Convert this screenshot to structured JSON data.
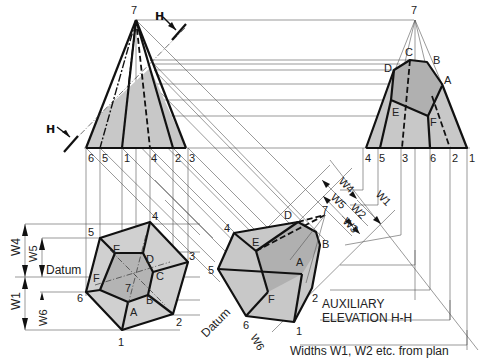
{
  "cutting_plane": {
    "label_top": "H",
    "label_bottom": "H"
  },
  "front_elevation": {
    "apex": "7",
    "base_points": [
      "6",
      "5",
      "1",
      "4",
      "2",
      "3"
    ]
  },
  "end_elevation": {
    "apex": "7",
    "section_points": [
      "C",
      "B",
      "D",
      "A",
      "E",
      "F"
    ],
    "base_points": [
      "4",
      "5",
      "3",
      "6",
      "2",
      "1"
    ]
  },
  "plan": {
    "outer_points": [
      "1",
      "2",
      "3",
      "4",
      "5",
      "6"
    ],
    "inner_points": [
      "A",
      "B",
      "C",
      "D",
      "E",
      "F"
    ],
    "center": "7",
    "datum_label": "Datum",
    "dims": [
      "W4",
      "W5",
      "W1",
      "W6"
    ]
  },
  "auxiliary": {
    "points": [
      "4",
      "5",
      "6",
      "1",
      "2",
      "D",
      "E",
      "A",
      "B",
      "F"
    ],
    "apex": "7",
    "dims": [
      "W4",
      "W5",
      "W1",
      "W2",
      "W3",
      "W6"
    ],
    "datum_label": "Datum",
    "title_line1": "AUXILIARY",
    "title_line2": "ELEVATION H-H"
  },
  "caption": "Widths W1, W2 etc. from plan",
  "colors": {
    "fill": "#c8c8c8",
    "fill_dark": "#b0b0b0",
    "line": "#111111",
    "thin": "#555555"
  }
}
